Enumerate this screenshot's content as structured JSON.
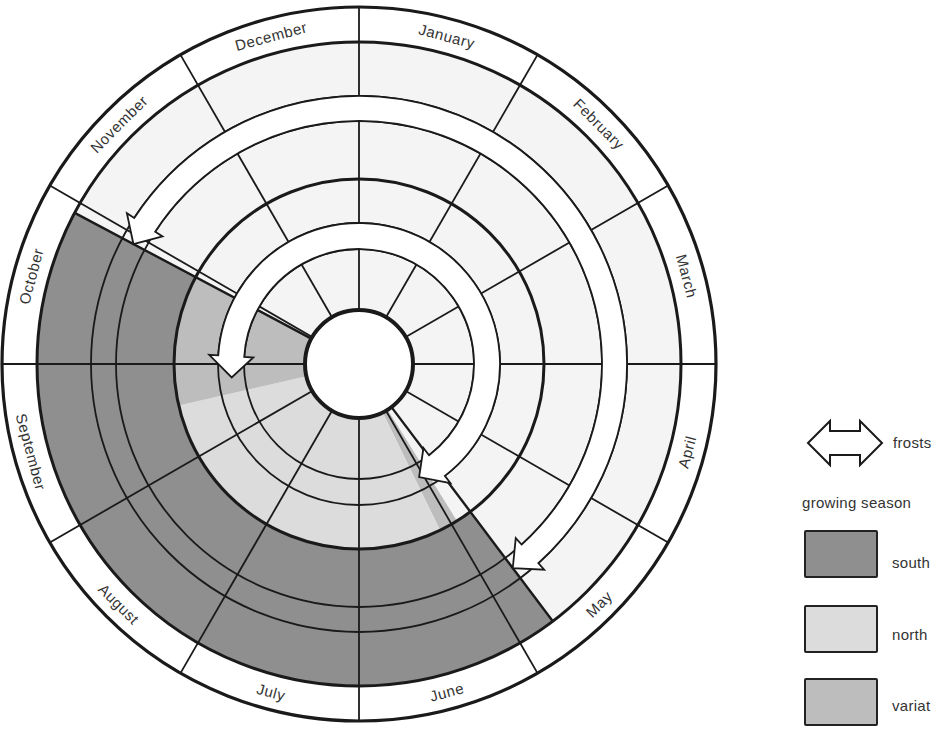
{
  "months": [
    "January",
    "February",
    "March",
    "April",
    "May",
    "June",
    "July",
    "August",
    "September",
    "October",
    "November",
    "December"
  ],
  "legend": {
    "frosts_label": "frosts",
    "growing_season_label": "growing season",
    "items": [
      {
        "label": "south",
        "color": "#8f8f8f"
      },
      {
        "label": "north",
        "color": "#dcdcdc"
      },
      {
        "label": "variat",
        "color": "#bdbdbd"
      }
    ]
  },
  "colors": {
    "south": "#8f8f8f",
    "north": "#dcdcdc",
    "variable": "#bdbdbd",
    "background_band": "#f4f4f4",
    "line": "#1a1a1a"
  },
  "geometry": {
    "center": [
      359,
      364
    ],
    "r_outer": 357,
    "r_label_inner": 322,
    "r_mid": 185,
    "r_core": 54,
    "outer_arrow_band": [
      243,
      268
    ],
    "inner_arrow_band": [
      115,
      141
    ]
  },
  "regions": {
    "outer_band": [
      {
        "type": "south",
        "from_deg": 143,
        "to_deg": 298
      }
    ],
    "inner_band": [
      {
        "type": "variable",
        "from_deg": 148,
        "to_deg": 154
      },
      {
        "type": "north",
        "from_deg": 154,
        "to_deg": 257
      },
      {
        "type": "variable",
        "from_deg": 257,
        "to_deg": 298
      }
    ]
  },
  "arrows": {
    "outer": {
      "from_deg": 298,
      "to_deg": 143
    },
    "inner": {
      "from_deg": 264,
      "to_deg": 152
    }
  }
}
